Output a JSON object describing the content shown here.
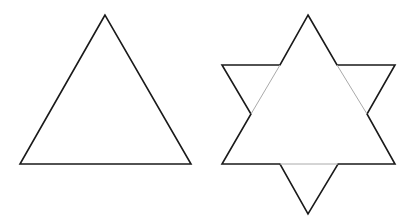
{
  "figure": {
    "background": "#ffffff",
    "stroke_color": "#1a1a1a",
    "inner_stroke_color": "#aaaaaa",
    "shapes": [
      {
        "name": "equilateral-triangle",
        "points": "105,15 20,164 191,164"
      },
      {
        "name": "hexagram-star",
        "outer_outline": "308,15 337,65 395,65 367,114 395,164 338,164 308,214 280,164 222,164 251,114 222,65 280,65",
        "inner_lines": [
          "280,65 251,114",
          "337,65 367,114",
          "280,164 338,164"
        ]
      }
    ]
  }
}
